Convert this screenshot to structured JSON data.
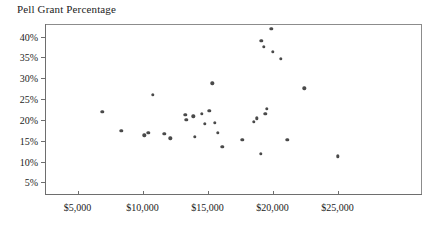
{
  "chart_data": {
    "type": "scatter",
    "title": "Pell Grant Percentage",
    "xlabel": "",
    "ylabel": "",
    "xlim": [
      2500,
      31500
    ],
    "ylim": [
      2.0,
      43.0
    ],
    "grid": false,
    "legend": null,
    "x_tick_labels": [
      "$5,000",
      "$10,000",
      "$15,000",
      "$20,000",
      "$25,000"
    ],
    "x_tick_values": [
      5000,
      10000,
      15000,
      20000,
      25000
    ],
    "y_tick_labels": [
      "5%",
      "10%",
      "15%",
      "20%",
      "25%",
      "30%",
      "35%",
      "40%"
    ],
    "y_tick_values": [
      5,
      10,
      15,
      20,
      25,
      30,
      35,
      40
    ],
    "points": [
      {
        "x": 6920,
        "y": 22.0
      },
      {
        "x": 8380,
        "y": 17.4
      },
      {
        "x": 10150,
        "y": 16.3
      },
      {
        "x": 10460,
        "y": 16.9
      },
      {
        "x": 10770,
        "y": 26.0
      },
      {
        "x": 11690,
        "y": 16.6
      },
      {
        "x": 12150,
        "y": 15.6
      },
      {
        "x": 13300,
        "y": 21.2
      },
      {
        "x": 13380,
        "y": 20.1
      },
      {
        "x": 13920,
        "y": 20.9
      },
      {
        "x": 14000,
        "y": 15.9
      },
      {
        "x": 14540,
        "y": 21.5
      },
      {
        "x": 14770,
        "y": 19.1
      },
      {
        "x": 15150,
        "y": 22.2
      },
      {
        "x": 15380,
        "y": 28.8
      },
      {
        "x": 15540,
        "y": 19.3
      },
      {
        "x": 15770,
        "y": 16.9
      },
      {
        "x": 16150,
        "y": 13.6
      },
      {
        "x": 17690,
        "y": 15.3
      },
      {
        "x": 18540,
        "y": 19.6
      },
      {
        "x": 18770,
        "y": 20.4
      },
      {
        "x": 19080,
        "y": 11.9
      },
      {
        "x": 19150,
        "y": 38.9
      },
      {
        "x": 19310,
        "y": 37.6
      },
      {
        "x": 19460,
        "y": 21.5
      },
      {
        "x": 19540,
        "y": 22.6
      },
      {
        "x": 19920,
        "y": 41.8
      },
      {
        "x": 20000,
        "y": 36.3
      },
      {
        "x": 20620,
        "y": 34.6
      },
      {
        "x": 21150,
        "y": 15.3
      },
      {
        "x": 22460,
        "y": 27.6
      },
      {
        "x": 25000,
        "y": 11.3
      }
    ]
  }
}
